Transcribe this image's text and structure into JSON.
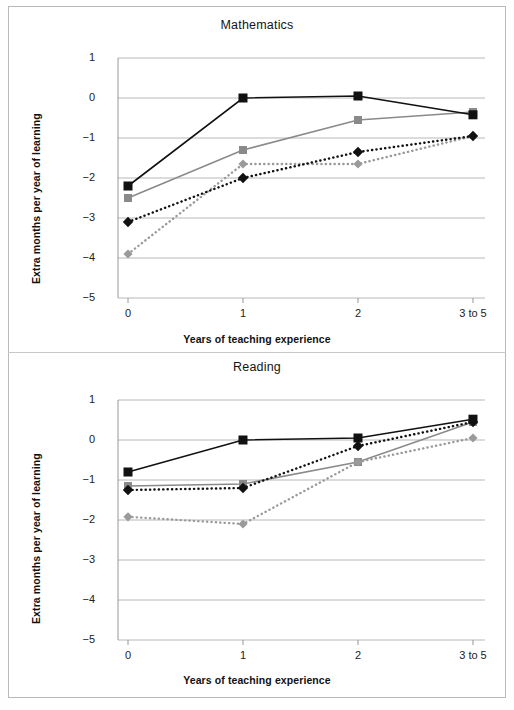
{
  "figure": {
    "border_color": "#b9b9b9",
    "background": "#ffffff"
  },
  "axis": {
    "y_ticks": [
      "1",
      "0",
      "−1",
      "−2",
      "−3",
      "−4",
      "−5"
    ],
    "x_ticks": [
      "0",
      "1",
      "2",
      "3 to 5"
    ],
    "y_label": "Extra months per year of learning",
    "x_label": "Years of teaching experience",
    "gridline_color": "#b0b0b0",
    "axis_color": "#8c8c8c"
  },
  "series_style": {
    "black_square": {
      "color": "#111111",
      "marker": "square",
      "line": "solid",
      "name": "black-solid-square"
    },
    "gray_square": {
      "color": "#8a8a8a",
      "marker": "square",
      "line": "solid",
      "name": "gray-solid-square"
    },
    "black_diamond": {
      "color": "#111111",
      "marker": "diamond",
      "line": "dotted",
      "name": "black-dotted-diamond"
    },
    "gray_diamond": {
      "color": "#9a9a9a",
      "marker": "diamond",
      "line": "dotted",
      "name": "gray-dotted-diamond"
    }
  },
  "chart_data": [
    {
      "type": "line",
      "title": "Mathematics",
      "xlabel": "Years of teaching experience",
      "ylabel": "Extra months per year of learning",
      "categories": [
        "0",
        "1",
        "2",
        "3 to 5"
      ],
      "ylim": [
        -5,
        1
      ],
      "yticks": [
        1,
        0,
        -1,
        -2,
        -3,
        -4,
        -5
      ],
      "grid": true,
      "legend": "none",
      "series": [
        {
          "name": "black-solid-square",
          "style": "solid",
          "marker": "square",
          "color": "#111111",
          "values": [
            -2.2,
            0.0,
            0.05,
            -0.42
          ]
        },
        {
          "name": "gray-solid-square",
          "style": "solid",
          "marker": "square",
          "color": "#8a8a8a",
          "values": [
            -2.5,
            -1.3,
            -0.55,
            -0.35
          ]
        },
        {
          "name": "black-dotted-diamond",
          "style": "dotted",
          "marker": "diamond",
          "color": "#111111",
          "values": [
            -3.1,
            -2.0,
            -1.35,
            -0.95
          ]
        },
        {
          "name": "gray-dotted-diamond",
          "style": "dotted",
          "marker": "diamond",
          "color": "#9a9a9a",
          "values": [
            -3.9,
            -1.65,
            -1.65,
            -0.95
          ]
        }
      ]
    },
    {
      "type": "line",
      "title": "Reading",
      "xlabel": "Years of teaching experience",
      "ylabel": "Extra months per year of learning",
      "categories": [
        "0",
        "1",
        "2",
        "3 to 5"
      ],
      "ylim": [
        -5,
        1
      ],
      "yticks": [
        1,
        0,
        -1,
        -2,
        -3,
        -4,
        -5
      ],
      "grid": true,
      "legend": "none",
      "series": [
        {
          "name": "black-solid-square",
          "style": "solid",
          "marker": "square",
          "color": "#111111",
          "values": [
            -0.8,
            0.0,
            0.05,
            0.52
          ]
        },
        {
          "name": "gray-solid-square",
          "style": "solid",
          "marker": "square",
          "color": "#8a8a8a",
          "values": [
            -1.15,
            -1.1,
            -0.55,
            0.45
          ]
        },
        {
          "name": "black-dotted-diamond",
          "style": "dotted",
          "marker": "diamond",
          "color": "#111111",
          "values": [
            -1.25,
            -1.2,
            -0.15,
            0.45
          ]
        },
        {
          "name": "gray-dotted-diamond",
          "style": "dotted",
          "marker": "diamond",
          "color": "#9a9a9a",
          "values": [
            -1.92,
            -2.1,
            -0.55,
            0.05
          ]
        }
      ]
    }
  ]
}
